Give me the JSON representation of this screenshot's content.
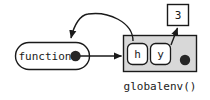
{
  "diagram": {
    "type": "environment-diagram",
    "caption": "globalenv()",
    "function_node": {
      "label": "function",
      "binding_dot": "filled-dot"
    },
    "environment": {
      "name": "globalenv()",
      "fill_color": "#d8d8d8",
      "border_color": "#1a1a1a",
      "bindings": [
        {
          "name": "h",
          "points_to": "function"
        },
        {
          "name": "y",
          "points_to": "3"
        }
      ],
      "env_dot": "filled-dot"
    },
    "value_box": {
      "value": "3",
      "fill_color": "#ffffff",
      "border_color": "#1a1a1a"
    },
    "arrows": [
      {
        "from": "function.binding_dot",
        "to": "globalenv",
        "style": "straight-right"
      },
      {
        "from": "globalenv.h",
        "to": "function",
        "style": "curved-arc"
      },
      {
        "from": "globalenv.y",
        "to": "value_box",
        "style": "straight-up"
      }
    ]
  }
}
